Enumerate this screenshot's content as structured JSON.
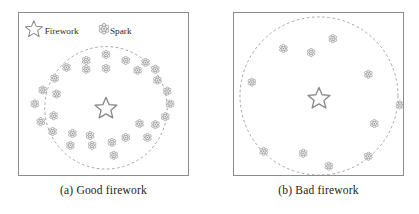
{
  "figure": {
    "colors": {
      "panel_border": "#8c8c8c",
      "circle_dashed": "#9a9a9a",
      "marker_stroke": "#8a8a8a",
      "marker_fill": "#f2f2f2",
      "text": "#1a1a1a"
    }
  },
  "legend": {
    "items": [
      {
        "icon": "star-outline-icon",
        "label": "Firework"
      },
      {
        "icon": "spark-flower-icon",
        "label": "Spark"
      }
    ]
  },
  "panels": [
    {
      "id": "good",
      "caption": "(a) Good firework",
      "has_legend": true,
      "circle": {
        "cx": 88,
        "cy": 96,
        "r": 62
      },
      "firework": {
        "x": 88,
        "y": 96
      },
      "sparks": [
        {
          "x": 88,
          "y": 42
        },
        {
          "x": 68,
          "y": 48
        },
        {
          "x": 108,
          "y": 48
        },
        {
          "x": 128,
          "y": 50
        },
        {
          "x": 48,
          "y": 55
        },
        {
          "x": 68,
          "y": 57
        },
        {
          "x": 88,
          "y": 56
        },
        {
          "x": 120,
          "y": 58
        },
        {
          "x": 138,
          "y": 57
        },
        {
          "x": 36,
          "y": 66
        },
        {
          "x": 140,
          "y": 68
        },
        {
          "x": 24,
          "y": 78
        },
        {
          "x": 150,
          "y": 79
        },
        {
          "x": 38,
          "y": 82
        },
        {
          "x": 16,
          "y": 92
        },
        {
          "x": 153,
          "y": 92
        },
        {
          "x": 35,
          "y": 104
        },
        {
          "x": 148,
          "y": 105
        },
        {
          "x": 22,
          "y": 110
        },
        {
          "x": 122,
          "y": 112
        },
        {
          "x": 138,
          "y": 113
        },
        {
          "x": 34,
          "y": 120
        },
        {
          "x": 54,
          "y": 122
        },
        {
          "x": 72,
          "y": 124
        },
        {
          "x": 108,
          "y": 126
        },
        {
          "x": 130,
          "y": 126
        },
        {
          "x": 52,
          "y": 134
        },
        {
          "x": 74,
          "y": 134
        },
        {
          "x": 94,
          "y": 131
        },
        {
          "x": 96,
          "y": 144
        }
      ]
    },
    {
      "id": "bad",
      "caption": "(b) Bad firework",
      "has_legend": false,
      "circle": {
        "cx": 86,
        "cy": 84,
        "r": 80
      },
      "firework": {
        "x": 86,
        "y": 86
      },
      "sparks": [
        {
          "x": 100,
          "y": 26
        },
        {
          "x": 50,
          "y": 36
        },
        {
          "x": 78,
          "y": 40
        },
        {
          "x": 136,
          "y": 62
        },
        {
          "x": 18,
          "y": 70
        },
        {
          "x": 168,
          "y": 93
        },
        {
          "x": 142,
          "y": 112
        },
        {
          "x": 30,
          "y": 140
        },
        {
          "x": 70,
          "y": 142
        },
        {
          "x": 136,
          "y": 145
        },
        {
          "x": 96,
          "y": 155
        }
      ]
    }
  ],
  "chart_data": {
    "type": "scatter",
    "subplots": [
      {
        "label": "(a) Good firework",
        "description": "Sparks densely and evenly distributed in a ring close to the dashed explosion radius around the central firework",
        "spark_count": 30,
        "firework_center": [
          88,
          96
        ],
        "explosion_radius": 62
      },
      {
        "label": "(b) Bad firework",
        "description": "Few sparks sparsely scattered within a large dashed explosion radius around the central firework",
        "spark_count": 11,
        "firework_center": [
          86,
          86
        ],
        "explosion_radius": 80
      }
    ],
    "legend": [
      "Firework",
      "Spark"
    ],
    "legend_position": "top-left of subplot (a)",
    "grid": false,
    "xlabel": "",
    "ylabel": ""
  }
}
